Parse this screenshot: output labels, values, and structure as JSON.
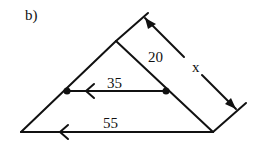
{
  "figure": {
    "part_label": "b)",
    "labels": {
      "upper_segment": "20",
      "side_total": "x",
      "midline": "35",
      "base": "55"
    },
    "colors": {
      "stroke": "#111111",
      "background": "#ffffff"
    }
  }
}
